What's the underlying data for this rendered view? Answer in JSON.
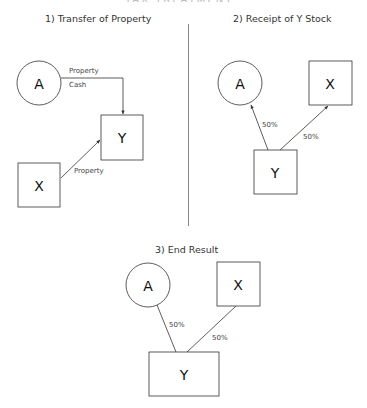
{
  "header_cut_text": "TAX TREATMENT",
  "panels": {
    "p1": {
      "title": "1) Transfer of Property",
      "nodes": {
        "A": "A",
        "Y": "Y",
        "X": "X"
      },
      "edges": {
        "a_to_y_label1": "Property",
        "a_to_y_label2": "Cash",
        "x_to_y_label": "Property"
      }
    },
    "p2": {
      "title": "2) Receipt of Y Stock",
      "nodes": {
        "A": "A",
        "X": "X",
        "Y": "Y"
      },
      "edges": {
        "y_to_a_label": "50%",
        "y_to_x_label": "50%"
      }
    },
    "p3": {
      "title": "3) End Result",
      "nodes": {
        "A": "A",
        "X": "X",
        "Y": "Y"
      },
      "edges": {
        "a_y_label": "50%",
        "x_y_label": "50%"
      }
    }
  },
  "colors": {
    "stroke": "#333333",
    "divider": "#888888",
    "text": "#333333"
  }
}
